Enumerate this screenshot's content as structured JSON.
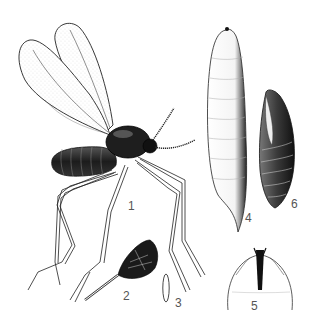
{
  "figure": {
    "type": "entomological illustration plate",
    "background": "#ffffff",
    "ink": "#1a1a1a"
  },
  "labels": [
    {
      "id": "adult",
      "text": "1",
      "x": 128,
      "y": 200
    },
    {
      "id": "leg-detail",
      "text": "2",
      "x": 123,
      "y": 290
    },
    {
      "id": "egg",
      "text": "3",
      "x": 175,
      "y": 297
    },
    {
      "id": "larva",
      "text": "4",
      "x": 245,
      "y": 212
    },
    {
      "id": "larva-head",
      "text": "5",
      "x": 251,
      "y": 300
    },
    {
      "id": "pupa",
      "text": "6",
      "x": 291,
      "y": 198
    }
  ]
}
